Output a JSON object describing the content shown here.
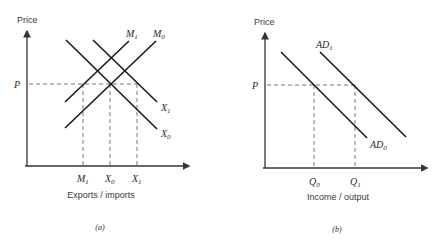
{
  "panels": [
    {
      "id": "a",
      "caption": "(a)",
      "y_axis_label": "Price",
      "x_axis_label": "Exports / imports",
      "price_level_label": "P",
      "curves": [
        {
          "name": "M1",
          "base": "M",
          "sub": "1",
          "type": "import-demand (upward)"
        },
        {
          "name": "M0",
          "base": "M",
          "sub": "0",
          "type": "import-demand (upward)"
        },
        {
          "name": "X1",
          "base": "X",
          "sub": "1",
          "type": "export-supply (downward)"
        },
        {
          "name": "X0",
          "base": "X",
          "sub": "0",
          "type": "export-supply (downward)"
        }
      ],
      "x_ticks": [
        {
          "base": "M",
          "sub": "1"
        },
        {
          "base": "X",
          "sub": "0"
        },
        {
          "base": "X",
          "sub": "1"
        }
      ]
    },
    {
      "id": "b",
      "caption": "(b)",
      "y_axis_label": "Price",
      "x_axis_label": "Income / output",
      "price_level_label": "P",
      "curves": [
        {
          "name": "AD1",
          "base": "AD",
          "sub": "1",
          "type": "aggregate demand (shifted)"
        },
        {
          "name": "AD0",
          "base": "AD",
          "sub": "0",
          "type": "aggregate demand (initial)"
        }
      ],
      "x_ticks": [
        {
          "base": "Q",
          "sub": "0"
        },
        {
          "base": "Q",
          "sub": "1"
        }
      ]
    }
  ]
}
